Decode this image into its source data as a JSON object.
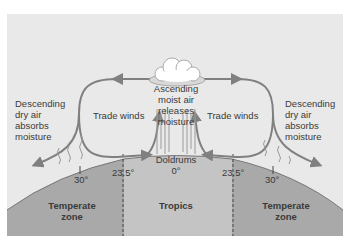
{
  "diagram": {
    "colors": {
      "background_panel": "#e9e9e9",
      "earth_temperate": "#a9a9a9",
      "earth_tropics": "#c4c4c4",
      "arrows": "#808080",
      "text": "#3a3a3a",
      "cloud": "#ffffff"
    },
    "labels": {
      "left_descending": [
        "Descending",
        "dry air",
        "absorbs",
        "moisture"
      ],
      "right_descending": [
        "Descending",
        "dry air",
        "absorbs",
        "moisture"
      ],
      "center_ascending": [
        "Ascending",
        "moist air",
        "releases",
        "moisture"
      ],
      "trade_winds_left": "Trade winds",
      "trade_winds_right": "Trade winds",
      "doldrums": "Doldrums",
      "equator_deg": "0°"
    },
    "latitudes": {
      "left_30": "30°",
      "left_23_5": "23.5°",
      "right_23_5": "23.5°",
      "right_30": "30°"
    },
    "zones": {
      "left": [
        "Temperate",
        "zone"
      ],
      "center": [
        "Tropics"
      ],
      "right": [
        "Temperate",
        "zone"
      ]
    }
  }
}
